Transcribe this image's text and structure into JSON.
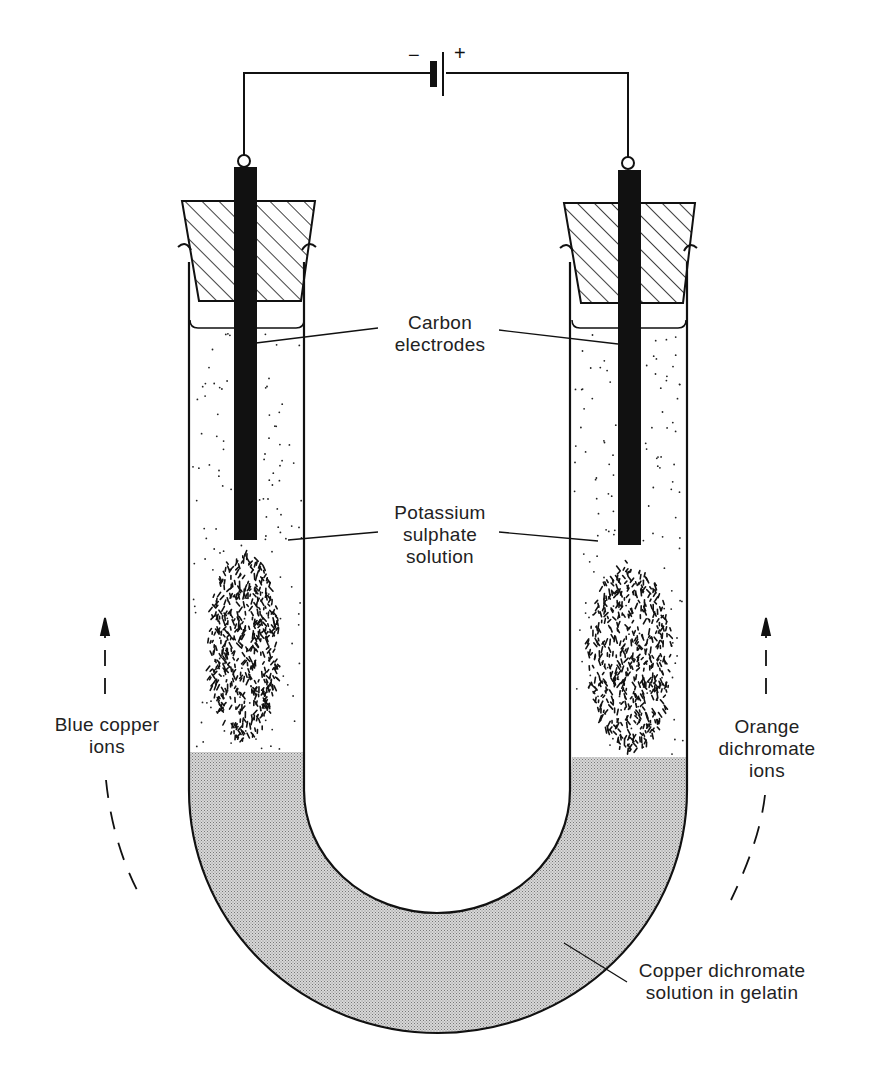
{
  "figure": {
    "type": "electrolysis U-tube diagram",
    "battery": {
      "negative_sign": "−",
      "positive_sign": "+"
    },
    "labels": {
      "carbon_electrodes": [
        "Carbon",
        "electrodes"
      ],
      "potassium_sulphate": [
        "Potassium",
        "sulphate",
        "solution"
      ],
      "blue_copper_ions": [
        "Blue copper",
        "ions"
      ],
      "orange_dichromate_ions": [
        "Orange",
        "dichromate",
        "ions"
      ],
      "copper_dichromate": [
        "Copper dichromate",
        "solution in gelatin"
      ]
    },
    "colors": {
      "ink": "#111111",
      "gel_fill": "#c9c9c9",
      "background": "#ffffff"
    }
  }
}
